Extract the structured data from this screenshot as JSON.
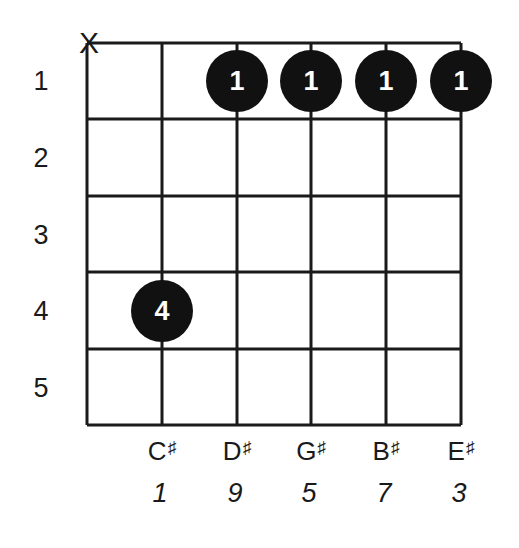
{
  "chord_diagram": {
    "strings": 6,
    "frets": 5,
    "muted_string_symbol": "X",
    "muted_string_index": 0,
    "fret_numbers": [
      "1",
      "2",
      "3",
      "4",
      "5"
    ],
    "fingerings": [
      {
        "string": 2,
        "fret": 1,
        "finger": "1"
      },
      {
        "string": 3,
        "fret": 1,
        "finger": "1"
      },
      {
        "string": 4,
        "fret": 1,
        "finger": "1"
      },
      {
        "string": 5,
        "fret": 1,
        "finger": "1"
      },
      {
        "string": 1,
        "fret": 4,
        "finger": "4"
      }
    ],
    "notes": [
      {
        "string": 1,
        "name": "C",
        "accidental": "♯",
        "interval": "1"
      },
      {
        "string": 2,
        "name": "D",
        "accidental": "♯",
        "interval": "9"
      },
      {
        "string": 3,
        "name": "G",
        "accidental": "♯",
        "interval": "5"
      },
      {
        "string": 4,
        "name": "B",
        "accidental": "♯",
        "interval": "7"
      },
      {
        "string": 5,
        "name": "E",
        "accidental": "♯",
        "interval": "3"
      }
    ],
    "colors": {
      "line": "#1a1a1a",
      "dot": "#111111",
      "dot_text": "#ffffff",
      "background": "#ffffff"
    }
  }
}
